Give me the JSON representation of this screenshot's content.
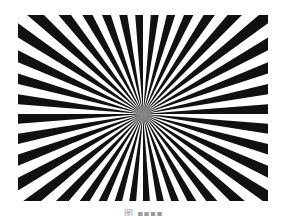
{
  "figure": {
    "type": "siemens-star",
    "spokes": 40,
    "center": {
      "x": 125,
      "y": 99
    },
    "width": 250,
    "height": 186,
    "colors": {
      "spoke": "#111111",
      "background": "#ffffff"
    }
  },
  "caption": {
    "text": "图 ■■■■"
  }
}
